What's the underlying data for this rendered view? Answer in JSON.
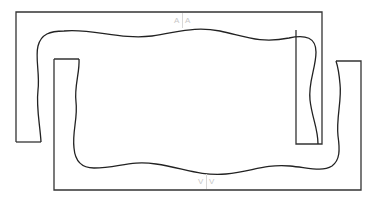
{
  "diagram": {
    "type": "interlocking-frames",
    "stroke_color": "#333333",
    "background": "#ffffff",
    "top_frame": {
      "shape": "inverted-U",
      "label_left": "A",
      "label_right": "A"
    },
    "bottom_frame": {
      "shape": "U",
      "label_left": "V",
      "label_right": "V"
    },
    "inner_outline": {
      "shape": "wavy-rounded-rectangle"
    }
  }
}
